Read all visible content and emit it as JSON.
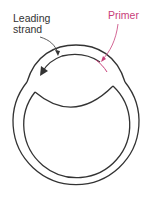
{
  "labels": {
    "leading_line1": "Leading",
    "leading_line2": "strand",
    "primer": "Primer"
  },
  "colors": {
    "stroke": "#333333",
    "primer": "#c8407a"
  }
}
